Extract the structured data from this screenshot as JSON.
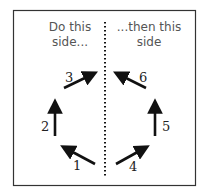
{
  "diagram": {
    "left_heading_line1": "Do this",
    "left_heading_line2": "side...",
    "right_heading_line1": "...then this",
    "right_heading_line2": "side",
    "steps": [
      {
        "label": "1",
        "side": "left",
        "direction": "up-left"
      },
      {
        "label": "2",
        "side": "left",
        "direction": "up"
      },
      {
        "label": "3",
        "side": "left",
        "direction": "up-right"
      },
      {
        "label": "4",
        "side": "right",
        "direction": "up-right"
      },
      {
        "label": "5",
        "side": "right",
        "direction": "up"
      },
      {
        "label": "6",
        "side": "right",
        "direction": "up-left"
      }
    ],
    "colors": {
      "border": "#333333",
      "arrow": "#111111",
      "divider": "#111111",
      "heading": "#555555"
    }
  }
}
